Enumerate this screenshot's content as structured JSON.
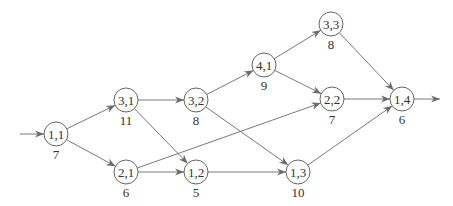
{
  "diagram": {
    "type": "directed-graph",
    "style": {
      "edge_color": "#6a6a6a",
      "node_stroke": "#555555",
      "text_color": "#333333",
      "background": "#ffffff"
    },
    "nodes": [
      {
        "id": "1,1",
        "label": "1,1",
        "weight": "7",
        "x": 56,
        "y": 134
      },
      {
        "id": "3,1",
        "label": "3,1",
        "weight": "11",
        "x": 126,
        "y": 100
      },
      {
        "id": "2,1",
        "label": "2,1",
        "weight": "6",
        "x": 126,
        "y": 172
      },
      {
        "id": "3,2",
        "label": "3,2",
        "weight": "8",
        "x": 196,
        "y": 100
      },
      {
        "id": "1,2",
        "label": "1,2",
        "weight": "5",
        "x": 196,
        "y": 172
      },
      {
        "id": "4,1",
        "label": "4,1",
        "weight": "9",
        "x": 264,
        "y": 65
      },
      {
        "id": "1,3",
        "label": "1,3",
        "weight": "10",
        "x": 298,
        "y": 172
      },
      {
        "id": "3,3",
        "label": "3,3",
        "weight": "8",
        "x": 331,
        "y": 24
      },
      {
        "id": "2,2",
        "label": "2,2",
        "weight": "7",
        "x": 332,
        "y": 99
      },
      {
        "id": "1,4",
        "label": "1,4",
        "weight": "6",
        "x": 402,
        "y": 99
      }
    ],
    "edges": [
      {
        "from": "1,1",
        "to": "3,1"
      },
      {
        "from": "1,1",
        "to": "2,1"
      },
      {
        "from": "3,1",
        "to": "3,2"
      },
      {
        "from": "3,1",
        "to": "1,2"
      },
      {
        "from": "2,1",
        "to": "1,2"
      },
      {
        "from": "2,1",
        "to": "2,2"
      },
      {
        "from": "3,2",
        "to": "4,1"
      },
      {
        "from": "3,2",
        "to": "1,3"
      },
      {
        "from": "1,2",
        "to": "1,3"
      },
      {
        "from": "4,1",
        "to": "3,3"
      },
      {
        "from": "4,1",
        "to": "2,2"
      },
      {
        "from": "3,3",
        "to": "1,4"
      },
      {
        "from": "2,2",
        "to": "1,4"
      },
      {
        "from": "1,3",
        "to": "1,4"
      }
    ],
    "source_arrow": {
      "from_x": 20,
      "to_node": "1,1"
    },
    "sink_arrow": {
      "from_node": "1,4",
      "to_x": 440
    }
  }
}
